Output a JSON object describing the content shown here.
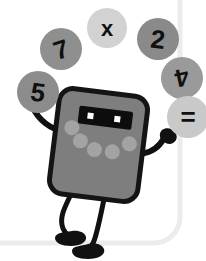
{
  "illustration": {
    "title": "Juggling calculator mascot",
    "canvas": {
      "width": 206,
      "height": 261
    },
    "background_color": "#ffffff"
  },
  "frame": {
    "name": "rounded-panel-border",
    "color": "#ececed",
    "stroke_width": 5,
    "vertical_line_x": 180,
    "horizontal_line_y": 243,
    "corner_radius": 26
  },
  "character": {
    "name": "calculator-mascot",
    "body_fill": "#7e7e7e",
    "outline_color": "#141414",
    "outline_width": 5,
    "display_fill": "#0d0d0d",
    "eye_fill": "#ffffff",
    "button_fill": "#a3a3a3",
    "limb_color": "#111111",
    "buttons_count": 5,
    "eyes_count": 2
  },
  "bubbles": [
    {
      "id": "bubble-7",
      "label": "7",
      "fill": "#8f8f8f",
      "cx": 61,
      "cy": 49,
      "r": 21,
      "font_size": 26,
      "rotation": -18
    },
    {
      "id": "bubble-x",
      "label": "x",
      "fill": "#d2d2d2",
      "cx": 107,
      "cy": 28,
      "r": 20,
      "font_size": 22,
      "rotation": 0
    },
    {
      "id": "bubble-2",
      "label": "2",
      "fill": "#8a8a8a",
      "cx": 158,
      "cy": 39,
      "r": 21,
      "font_size": 26,
      "rotation": 6
    },
    {
      "id": "bubble-5",
      "label": "5",
      "fill": "#8c8c8c",
      "cx": 38,
      "cy": 92,
      "r": 21,
      "font_size": 26,
      "rotation": 8
    },
    {
      "id": "bubble-4",
      "label": "4",
      "fill": "#9a9a9a",
      "cx": 182,
      "cy": 78,
      "r": 21,
      "font_size": 25,
      "rotation": 168
    },
    {
      "id": "bubble-equals",
      "label": "=",
      "fill": "#c9c9c9",
      "cx": 188,
      "cy": 117,
      "r": 21,
      "font_size": 26,
      "rotation": 0
    }
  ]
}
